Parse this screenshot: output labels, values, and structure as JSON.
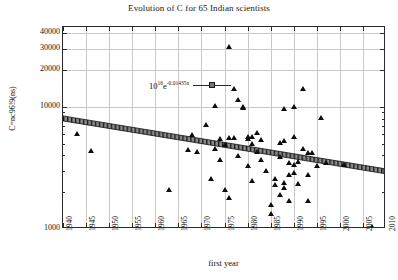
{
  "chart_data": {
    "type": "scatter",
    "title": "Evolution of C for 65 Indian scientists",
    "xlabel": "first year",
    "ylabel": "C=nc96!9(ns)",
    "xlim": [
      1940,
      2010
    ],
    "ylim": [
      1000,
      45000
    ],
    "yscale": "log",
    "xscale": "linear",
    "grid": true,
    "legend_position": "upper-left",
    "xticks": [
      1940,
      1945,
      1950,
      1955,
      1960,
      1965,
      1970,
      1975,
      1980,
      1985,
      1990,
      1995,
      2000,
      2005,
      2010
    ],
    "yticks": [
      1000,
      10000,
      20000,
      30000,
      40000
    ],
    "ytick_labels": [
      "1000",
      "10000",
      "20000",
      "30000",
      "40000"
    ],
    "series": [
      {
        "name": "scientists",
        "marker": "triangle",
        "color": "#0d0d0d",
        "points": [
          [
            1943,
            6000
          ],
          [
            1946,
            4400
          ],
          [
            1963,
            2100
          ],
          [
            1967,
            4500
          ],
          [
            1968,
            5900
          ],
          [
            1969,
            4300
          ],
          [
            1971,
            7100
          ],
          [
            1972,
            2600
          ],
          [
            1973,
            10200
          ],
          [
            1973,
            4600
          ],
          [
            1974,
            3700
          ],
          [
            1974,
            5500
          ],
          [
            1975,
            4900
          ],
          [
            1975,
            2100
          ],
          [
            1976,
            31000
          ],
          [
            1976,
            5600
          ],
          [
            1976,
            1800
          ],
          [
            1977,
            14000
          ],
          [
            1977,
            5600
          ],
          [
            1978,
            11500
          ],
          [
            1978,
            4000
          ],
          [
            1979,
            10000
          ],
          [
            1979,
            9800
          ],
          [
            1980,
            5500
          ],
          [
            1980,
            5700
          ],
          [
            1980,
            3300
          ],
          [
            1981,
            5700
          ],
          [
            1981,
            5000
          ],
          [
            1981,
            2500
          ],
          [
            1982,
            6200
          ],
          [
            1982,
            4300
          ],
          [
            1983,
            3700
          ],
          [
            1983,
            5400
          ],
          [
            1984,
            3000
          ],
          [
            1985,
            1600
          ],
          [
            1985,
            1350
          ],
          [
            1986,
            2600
          ],
          [
            1986,
            2300
          ],
          [
            1987,
            5100
          ],
          [
            1987,
            3900
          ],
          [
            1987,
            1900
          ],
          [
            1988,
            9600
          ],
          [
            1988,
            5300
          ],
          [
            1988,
            2400
          ],
          [
            1988,
            2200
          ],
          [
            1989,
            3500
          ],
          [
            1989,
            2800
          ],
          [
            1989,
            1700
          ],
          [
            1990,
            10000
          ],
          [
            1990,
            5700
          ],
          [
            1990,
            3400
          ],
          [
            1990,
            2900
          ],
          [
            1991,
            3600
          ],
          [
            1991,
            2350
          ],
          [
            1992,
            14000
          ],
          [
            1992,
            4600
          ],
          [
            1993,
            4200
          ],
          [
            1993,
            2800
          ],
          [
            1993,
            1700
          ],
          [
            1994,
            4200
          ],
          [
            1995,
            3300
          ],
          [
            1996,
            8200
          ],
          [
            1997,
            3500
          ],
          [
            2001,
            3400
          ],
          [
            2007,
            1050
          ]
        ]
      }
    ],
    "trend": {
      "label": "10¹⁶e⁻⁰·⁰¹⁴³⁵ˣ",
      "base_mantissa": "10",
      "base_exponent": "16",
      "exp_coefficient": "-0.01435",
      "exp_variable": "x",
      "style": "hatched-band",
      "marker": "square",
      "y_at_1940": 7900,
      "y_at_2010": 2900
    }
  },
  "legend": {
    "equation_base": "10",
    "equation_exponent": "16",
    "equation_e": "e",
    "equation_e_exponent": "-0.01435x"
  }
}
